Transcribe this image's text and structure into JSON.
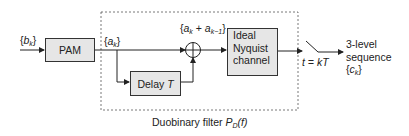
{
  "diagram": {
    "caption_prefix": "Duobinary filter ",
    "caption_func": "P",
    "caption_sub": "D",
    "caption_arg": "(f)",
    "input": {
      "brace_open": "{",
      "symbol": "b",
      "sub": "k",
      "brace_close": "}"
    },
    "blocks": {
      "pam": "PAM",
      "delay_prefix": "Delay ",
      "delay_var": "T",
      "channel_line1": "Ideal",
      "channel_line2": "Nyquist",
      "channel_line3": "channel"
    },
    "signals": {
      "a": {
        "brace_open": "{",
        "symbol": "a",
        "sub": "k",
        "brace_close": "}"
      },
      "sum": {
        "text1": "{",
        "a1": "a",
        "sub1": "k",
        "plus": " + ",
        "a2": "a",
        "sub2": "k−1",
        "text2": "}"
      }
    },
    "sampler": {
      "label": "t = kT"
    },
    "output": {
      "line1": "3-level",
      "line2": "sequence",
      "brace_open": "{",
      "symbol": "c",
      "sub": "k",
      "brace_close": "}"
    },
    "colors": {
      "block_fill": "#e6e6e6",
      "stroke": "#333333"
    }
  }
}
